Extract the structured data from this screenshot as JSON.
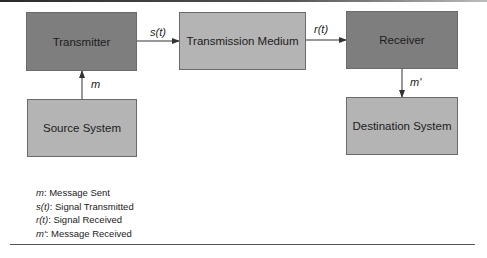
{
  "diagram": {
    "nodes": [
      {
        "id": "transmitter",
        "label": "Transmitter",
        "shade": "dark"
      },
      {
        "id": "medium",
        "label": "Transmission Medium",
        "shade": "light"
      },
      {
        "id": "receiver",
        "label": "Receiver",
        "shade": "dark"
      },
      {
        "id": "source",
        "label": "Source System",
        "shade": "light"
      },
      {
        "id": "destination",
        "label": "Destination System",
        "shade": "light"
      }
    ],
    "edges": [
      {
        "from": "source",
        "to": "transmitter",
        "label": "m"
      },
      {
        "from": "transmitter",
        "to": "medium",
        "label": "s(t)"
      },
      {
        "from": "medium",
        "to": "receiver",
        "label": "r(t)"
      },
      {
        "from": "receiver",
        "to": "destination",
        "label": "m'"
      }
    ],
    "legend": [
      {
        "symbol": "m",
        "text": ": Message Sent"
      },
      {
        "symbol": "s(t)",
        "text": ": Signal Transmitted"
      },
      {
        "symbol": "r(t)",
        "text": ": Signal Received"
      },
      {
        "symbol": "m'",
        "text": ": Message Received"
      }
    ],
    "colors": {
      "dark_box": "#7e7e7e",
      "light_box": "#b4b4b4",
      "line": "#333333"
    }
  }
}
